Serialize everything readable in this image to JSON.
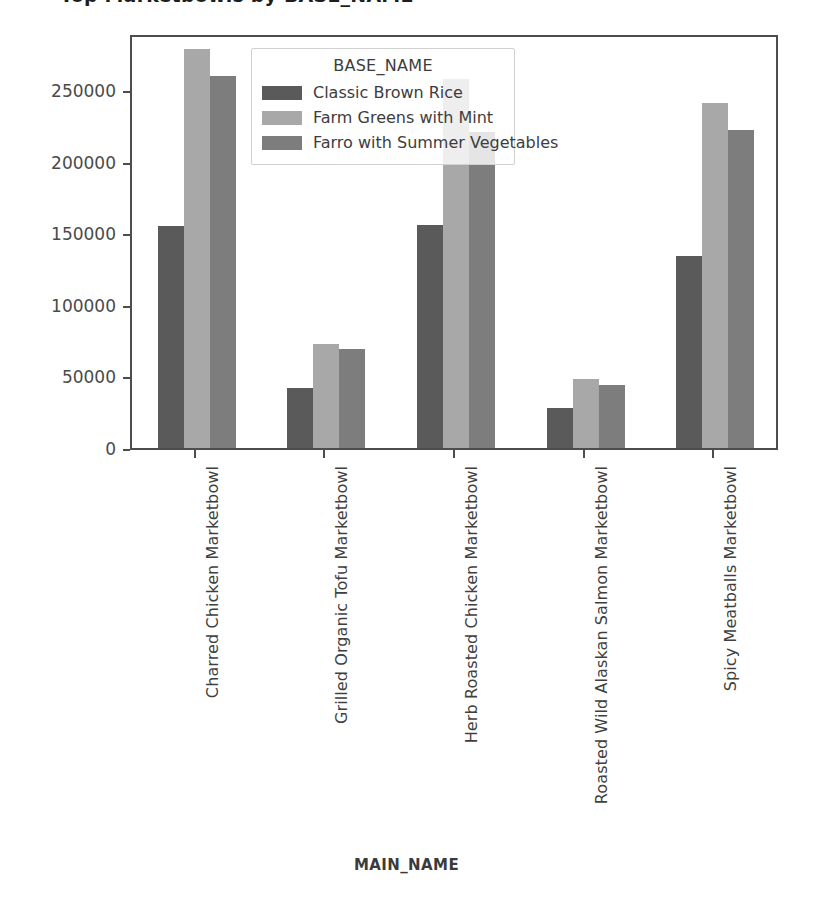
{
  "chart_data": {
    "type": "bar",
    "title": "Top Marketbowls by BASE_NAME",
    "xlabel": "MAIN_NAME",
    "ylabel": "",
    "grid": false,
    "legend_position": "upper center",
    "legend_title": "BASE_NAME",
    "ylim": [
      0,
      290000
    ],
    "yticks": [
      0,
      50000,
      100000,
      150000,
      200000,
      250000
    ],
    "ytick_labels": [
      "0",
      "50000",
      "100000",
      "150000",
      "200000",
      "250000"
    ],
    "categories": [
      "Charred Chicken Marketbowl",
      "Grilled Organic Tofu Marketbowl",
      "Herb Roasted Chicken Marketbowl",
      "Roasted Wild Alaskan Salmon Marketbowl",
      "Spicy Meatballs Marketbowl"
    ],
    "series": [
      {
        "name": "Classic Brown Rice",
        "color": "#5a5a5a",
        "values": [
          155000,
          42000,
          156000,
          28000,
          134000
        ]
      },
      {
        "name": "Farm Greens with Mint",
        "color": "#a8a8a8",
        "values": [
          279000,
          73000,
          258000,
          48000,
          241000
        ]
      },
      {
        "name": "Farro with Summer Vegetables",
        "color": "#7d7d7d",
        "values": [
          260000,
          69000,
          221000,
          44000,
          222000
        ]
      }
    ]
  },
  "axes": {
    "frame_color": "#4d4d4d",
    "background": "#ffffff"
  }
}
